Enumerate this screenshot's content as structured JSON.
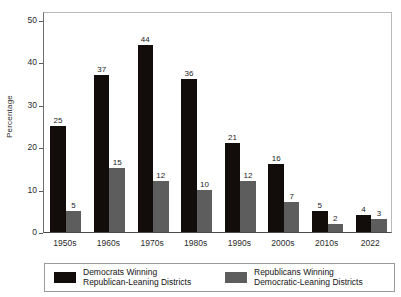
{
  "chart_data": {
    "type": "bar",
    "title": "",
    "subtitle": "",
    "xlabel": "",
    "ylabel": "Percentage",
    "categories": [
      "1950s",
      "1960s",
      "1970s",
      "1980s",
      "1990s",
      "2000s",
      "2010s",
      "2022"
    ],
    "series": [
      {
        "name": "Democrats Winning Republican-Leaning Districts",
        "legend_line_1": "Democrats Winning",
        "legend_line_2": "Republican-Leaning Districts",
        "color": "#120d0a",
        "values": [
          25,
          37,
          44,
          36,
          21,
          16,
          5,
          4
        ]
      },
      {
        "name": "Republicans Winning Democratic-Leaning Districts",
        "legend_line_1": "Republicans Winning",
        "legend_line_2": "Democratic-Leaning Districts",
        "color": "#5d5d5d",
        "values": [
          5,
          15,
          12,
          10,
          12,
          7,
          2,
          3
        ]
      }
    ],
    "yticks": [
      0,
      10,
      20,
      30,
      40,
      50
    ],
    "ylim": [
      0,
      52
    ],
    "grid": false,
    "data_labels": true,
    "legend_position": "bottom"
  },
  "axes": {
    "y_title": "Percentage"
  }
}
